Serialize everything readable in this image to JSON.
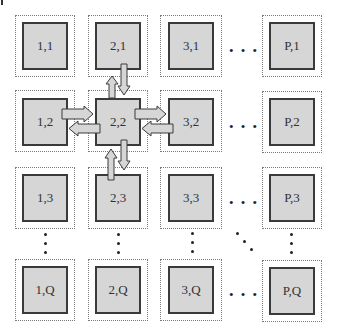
{
  "diagram": {
    "title": "",
    "colors": {
      "inner_fill": "#d6d6d6",
      "inner_border": "#3a3a3a",
      "outer_border": "#7a7a7a",
      "arrow_fill": "#d6d6d6",
      "arrow_stroke": "#3a3a3a"
    },
    "nodes": [
      {
        "id": "1,1",
        "label": "1,1"
      },
      {
        "id": "2,1",
        "label": "2,1"
      },
      {
        "id": "3,1",
        "label": "3,1"
      },
      {
        "id": "P,1",
        "label": "P,1"
      },
      {
        "id": "1,2",
        "label": "1,2"
      },
      {
        "id": "2,2",
        "label": "2,2"
      },
      {
        "id": "3,2",
        "label": "3,2"
      },
      {
        "id": "P,2",
        "label": "P,2"
      },
      {
        "id": "1,3",
        "label": "1,3"
      },
      {
        "id": "2,3",
        "label": "2,3"
      },
      {
        "id": "3,3",
        "label": "3,3"
      },
      {
        "id": "P,3",
        "label": "P,3"
      },
      {
        "id": "1,Q",
        "label": "1,Q"
      },
      {
        "id": "2,Q",
        "label": "2,Q"
      },
      {
        "id": "3,Q",
        "label": "3,Q"
      },
      {
        "id": "P,Q",
        "label": "P,Q"
      }
    ],
    "ellipsis": "• • •",
    "edges": [
      {
        "from": "2,2",
        "to": "2,1"
      },
      {
        "from": "2,1",
        "to": "2,2"
      },
      {
        "from": "1,2",
        "to": "2,2"
      },
      {
        "from": "2,2",
        "to": "1,2"
      },
      {
        "from": "2,2",
        "to": "3,2"
      },
      {
        "from": "3,2",
        "to": "2,2"
      },
      {
        "from": "2,2",
        "to": "2,3"
      },
      {
        "from": "2,3",
        "to": "2,2"
      }
    ]
  }
}
